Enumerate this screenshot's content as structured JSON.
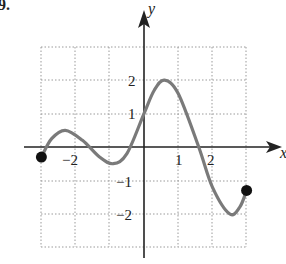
{
  "problem_label": "9.",
  "chart_data": {
    "type": "line",
    "title": "",
    "xlabel": "x",
    "ylabel": "y",
    "xlim": [
      -3,
      3
    ],
    "ylim": [
      -3,
      3
    ],
    "grid": true,
    "x_tick_labels": [
      "-2",
      "2"
    ],
    "y_tick_labels": [
      "2",
      "1",
      "-1",
      "-2"
    ],
    "x_ticks_drawn": [
      -3,
      -2,
      -1,
      1,
      2,
      3
    ],
    "y_ticks_drawn": [
      -3,
      -2,
      -1,
      1,
      2,
      3
    ],
    "series": [
      {
        "name": "f(x)",
        "color": "#7a7a7a",
        "endpoints_closed": true,
        "points": [
          {
            "x": -3.0,
            "y": -0.3
          },
          {
            "x": -2.7,
            "y": 0.25
          },
          {
            "x": -2.3,
            "y": 0.5
          },
          {
            "x": -1.8,
            "y": 0.2
          },
          {
            "x": -1.3,
            "y": -0.3
          },
          {
            "x": -0.9,
            "y": -0.5
          },
          {
            "x": -0.5,
            "y": -0.2
          },
          {
            "x": 0.0,
            "y": 1.0
          },
          {
            "x": 0.3,
            "y": 1.7
          },
          {
            "x": 0.6,
            "y": 2.0
          },
          {
            "x": 1.0,
            "y": 1.6
          },
          {
            "x": 1.6,
            "y": 0.0
          },
          {
            "x": 2.0,
            "y": -1.2
          },
          {
            "x": 2.5,
            "y": -2.0
          },
          {
            "x": 2.8,
            "y": -1.8
          },
          {
            "x": 3.0,
            "y": -1.3
          }
        ]
      }
    ]
  },
  "labels": {
    "x_axis": "x",
    "y_axis": "y",
    "x_neg2": "−2",
    "x_1": "1",
    "x_2": "2",
    "y_2": "2",
    "y_1": "1",
    "y_neg1": "−1",
    "y_neg2": "−2"
  }
}
